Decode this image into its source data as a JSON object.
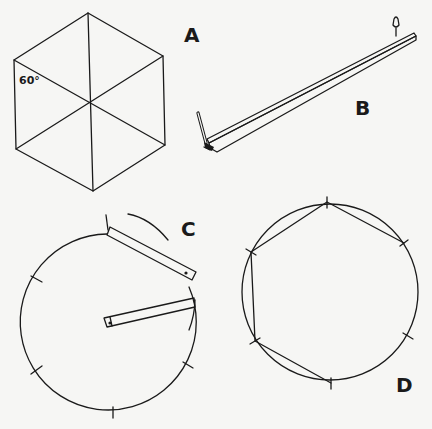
{
  "panels": {
    "A": {
      "label": "A",
      "angle_label": "60°",
      "description": "regular hexagon divided into six equilateral triangles"
    },
    "B": {
      "label": "B",
      "description": "compass strip with pencil at one end and pivot pin at the other"
    },
    "C": {
      "label": "C",
      "description": "circle being stepped off with a strip compass set to the radius; six tick marks"
    },
    "D": {
      "label": "D",
      "description": "circle with six tick marks joined by chords to form a hexagon"
    }
  },
  "colors": {
    "ink": "#1a1a1a",
    "paper": "#f6f6f4"
  }
}
